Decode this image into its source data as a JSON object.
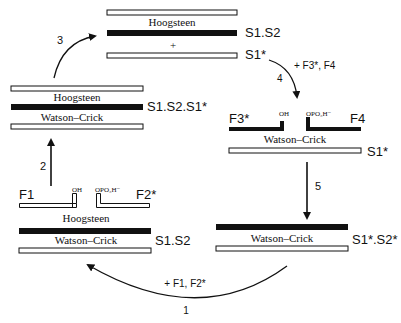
{
  "diagram": {
    "colors": {
      "ink": "#111111",
      "open_fill": "#ffffff",
      "bg": "#ffffff"
    },
    "complexes": {
      "top": {
        "label": "S1.S2",
        "pairing": "Hoogsteen",
        "plus": "+",
        "free_strand_label": "S1*"
      },
      "left": {
        "label": "S1.S2.S1*",
        "top_pairing": "Hoogsteen",
        "bottom_pairing": "Watson–Crick"
      },
      "right": {
        "fragment_left": "F3*",
        "fragment_right": "F4",
        "oh": "OH",
        "phosphate": "OPO₃H⁻",
        "pairing": "Watson–Crick",
        "strand_label": "S1*"
      },
      "bottom_left": {
        "fragment_left": "F1",
        "fragment_right": "F2*",
        "oh": "OH",
        "phosphate": "OPO₃H⁻",
        "top_pairing": "Hoogsteen",
        "bottom_pairing": "Watson–Crick",
        "label": "S1.S2"
      },
      "bottom_right": {
        "pairing": "Watson–Crick",
        "label": "S1*.S2*"
      }
    },
    "steps": [
      {
        "number": "1",
        "reagents": "+ F1, F2*"
      },
      {
        "number": "2",
        "reagents": ""
      },
      {
        "number": "3",
        "reagents": ""
      },
      {
        "number": "4",
        "reagents": "+ F3*, F4"
      },
      {
        "number": "5",
        "reagents": ""
      }
    ]
  }
}
